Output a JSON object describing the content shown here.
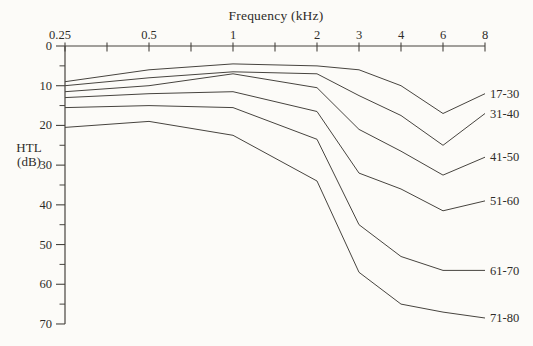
{
  "figure": {
    "xlabel": "Frequency (kHz)",
    "ylabel_line1": "HTL",
    "ylabel_line2": "(dB)"
  },
  "chart_data": {
    "type": "line",
    "title": "",
    "xlabel": "Frequency (kHz)",
    "ylabel": "HTL (dB)",
    "categories": [
      0.25,
      0.5,
      1,
      2,
      3,
      4,
      6,
      8
    ],
    "x_tick_labels": [
      "0.25",
      "0.5",
      "1",
      "2",
      "3",
      "4",
      "6",
      "8"
    ],
    "x_scale": "octave",
    "y_ticks": [
      0,
      10,
      20,
      30,
      40,
      50,
      60,
      70
    ],
    "y_minor_tick_step": 5,
    "ylim": [
      0,
      70
    ],
    "y_axis_inverted": true,
    "grid": "off",
    "legend_position": "labels-at-right-end-of-lines",
    "series": [
      {
        "name": "17-30",
        "values": [
          9,
          6,
          4.5,
          5,
          6,
          10,
          17,
          12
        ]
      },
      {
        "name": "31-40",
        "values": [
          10,
          8,
          6.5,
          7,
          12.5,
          17.5,
          25,
          17
        ]
      },
      {
        "name": "41-50",
        "values": [
          11.5,
          10,
          7,
          10.5,
          21,
          26.5,
          32.5,
          28
        ]
      },
      {
        "name": "51-60",
        "values": [
          13,
          12,
          11.5,
          16.5,
          32,
          36,
          41.5,
          39
        ]
      },
      {
        "name": "61-70",
        "values": [
          15.5,
          15,
          15.5,
          23.5,
          45,
          53,
          56.5,
          56.5
        ]
      },
      {
        "name": "71-80",
        "values": [
          20.5,
          19,
          22.5,
          34,
          57,
          65,
          67,
          68.5
        ]
      }
    ],
    "line_color": "#47443f",
    "text_color": "#2e2c29",
    "background_color": "#fcfbf8"
  }
}
